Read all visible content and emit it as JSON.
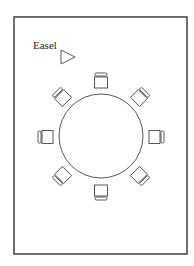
{
  "diagram": {
    "type": "floor-plan",
    "colors": {
      "stroke": "#333333",
      "background": "#ffffff"
    },
    "room": {
      "x": 14,
      "y": 17,
      "width": 173,
      "height": 237
    },
    "easel": {
      "label": "Easel",
      "label_x": 33,
      "label_y": 49,
      "icon": "triangle-play-icon",
      "tri": [
        [
          61,
          50
        ],
        [
          61,
          64
        ],
        [
          75,
          57
        ]
      ]
    },
    "table": {
      "shape": "circle",
      "cx": 101,
      "cy": 136,
      "r": 42
    },
    "chairs": [
      {
        "name": "chair-north",
        "cx": 101,
        "cy": 81,
        "angle": 0
      },
      {
        "name": "chair-northeast",
        "cx": 140,
        "cy": 97,
        "angle": 45
      },
      {
        "name": "chair-east",
        "cx": 156,
        "cy": 137,
        "angle": 90
      },
      {
        "name": "chair-southeast",
        "cx": 140,
        "cy": 176,
        "angle": 135
      },
      {
        "name": "chair-south",
        "cx": 101,
        "cy": 192,
        "angle": 180
      },
      {
        "name": "chair-southwest",
        "cx": 62,
        "cy": 176,
        "angle": 225
      },
      {
        "name": "chair-west",
        "cx": 46,
        "cy": 137,
        "angle": 270
      },
      {
        "name": "chair-northwest",
        "cx": 62,
        "cy": 97,
        "angle": 315
      }
    ]
  }
}
